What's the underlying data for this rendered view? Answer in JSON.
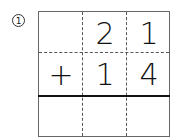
{
  "problem": {
    "number_label": "1",
    "rows": [
      [
        "",
        "2",
        "1"
      ],
      [
        "+",
        "1",
        "4"
      ],
      [
        "",
        "",
        ""
      ]
    ]
  }
}
